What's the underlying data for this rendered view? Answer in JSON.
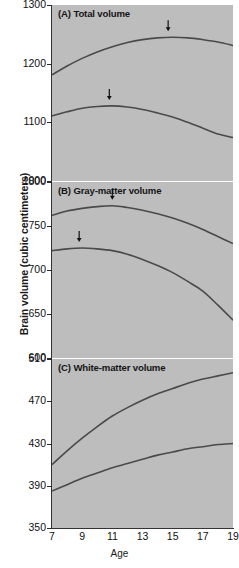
{
  "figure": {
    "ylabel": "Brain volume (cubic centimeters)",
    "xlabel": "Age"
  },
  "panels": [
    {
      "key": "A",
      "title": "(A) Total volume",
      "ylim": [
        1000,
        1300
      ],
      "yticks": [
        "1300",
        "1200",
        "1100",
        "1000"
      ],
      "ytick_values": [
        1300,
        1200,
        1100,
        1000
      ]
    },
    {
      "key": "B",
      "title": "(B) Gray-matter volume",
      "ylim": [
        600,
        800
      ],
      "yticks": [
        "800",
        "750",
        "700",
        "650",
        "600"
      ],
      "ytick_values": [
        800,
        750,
        700,
        650,
        600
      ]
    },
    {
      "key": "C",
      "title": "(C) White-matter volume",
      "ylim": [
        350,
        510
      ],
      "yticks": [
        "510",
        "470",
        "430",
        "390",
        "350"
      ],
      "ytick_values": [
        510,
        470,
        430,
        390,
        350
      ]
    }
  ],
  "xticks": [
    "7",
    "9",
    "11",
    "13",
    "15",
    "17",
    "19"
  ],
  "xtick_values": [
    7,
    9,
    11,
    13,
    15,
    17,
    19
  ],
  "colors": {
    "panel_background": "#bdbdbd",
    "curve": "#4a4a4a",
    "axis": "#333333",
    "text": "#111111"
  },
  "chart_data": [
    {
      "type": "line",
      "panel": "A",
      "title": "(A) Total volume",
      "xlabel": "Age",
      "ylabel": "Brain volume (cubic centimeters)",
      "xlim": [
        7,
        19
      ],
      "ylim": [
        1000,
        1300
      ],
      "grid": false,
      "legend": "none",
      "x": [
        7,
        8,
        9,
        10,
        11,
        12,
        13,
        14,
        15,
        16,
        17,
        18,
        19
      ],
      "series": [
        {
          "name": "Upper curve",
          "values": [
            1181,
            1196,
            1209,
            1220,
            1229,
            1236,
            1241,
            1244,
            1245,
            1244,
            1241,
            1237,
            1231
          ],
          "peak_age": 14.7,
          "peak_value": 1245,
          "annotation": "arrow marking peak"
        },
        {
          "name": "Lower curve",
          "values": [
            1111,
            1118,
            1124,
            1127,
            1128,
            1126,
            1122,
            1116,
            1109,
            1100,
            1090,
            1080,
            1074
          ],
          "peak_age": 10.8,
          "peak_value": 1128,
          "annotation": "arrow marking peak"
        }
      ]
    },
    {
      "type": "line",
      "panel": "B",
      "title": "(B) Gray-matter volume",
      "xlabel": "Age",
      "ylabel": "Brain volume (cubic centimeters)",
      "xlim": [
        7,
        19
      ],
      "ylim": [
        600,
        800
      ],
      "grid": false,
      "legend": "none",
      "x": [
        7,
        8,
        9,
        10,
        11,
        12,
        13,
        14,
        15,
        16,
        17,
        18,
        19
      ],
      "series": [
        {
          "name": "Upper curve",
          "values": [
            762,
            767,
            770,
            772,
            773,
            771,
            768,
            764,
            759,
            753,
            746,
            738,
            730
          ],
          "peak_age": 11.0,
          "peak_value": 773,
          "annotation": "arrow marking peak"
        },
        {
          "name": "Lower curve",
          "values": [
            722,
            724,
            725,
            724,
            722,
            718,
            712,
            705,
            697,
            687,
            676,
            660,
            643
          ],
          "peak_age": 8.8,
          "peak_value": 725,
          "annotation": "arrow marking peak"
        }
      ]
    },
    {
      "type": "line",
      "panel": "C",
      "title": "(C) White-matter volume",
      "xlabel": "Age",
      "ylabel": "Brain volume (cubic centimeters)",
      "xlim": [
        7,
        19
      ],
      "ylim": [
        350,
        510
      ],
      "grid": false,
      "legend": "none",
      "x": [
        7,
        8,
        9,
        10,
        11,
        12,
        13,
        14,
        15,
        16,
        17,
        18,
        19
      ],
      "series": [
        {
          "name": "Upper curve",
          "values": [
            410,
            423,
            435,
            446,
            456,
            464,
            471,
            477,
            482,
            487,
            491,
            494,
            497
          ]
        },
        {
          "name": "Lower curve",
          "values": [
            385,
            391,
            397,
            402,
            407,
            411,
            415,
            419,
            422,
            425,
            427,
            429,
            430
          ]
        }
      ]
    }
  ]
}
